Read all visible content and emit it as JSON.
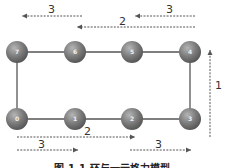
{
  "diagram": {
    "colors": {
      "node_fill": "#7a7a7a",
      "node_highlight": "#a8a8a8",
      "edge": "#555555",
      "arrow": "#555555",
      "text": "#333333"
    },
    "nodes": [
      {
        "id": "0",
        "label": "0",
        "row": "bottom",
        "col": 0
      },
      {
        "id": "1",
        "label": "1",
        "row": "bottom",
        "col": 1
      },
      {
        "id": "2",
        "label": "2",
        "row": "bottom",
        "col": 2
      },
      {
        "id": "3",
        "label": "3",
        "row": "bottom",
        "col": 3
      },
      {
        "id": "4",
        "label": "4",
        "row": "top",
        "col": 3
      },
      {
        "id": "5",
        "label": "5",
        "row": "top",
        "col": 2
      },
      {
        "id": "6",
        "label": "6",
        "row": "top",
        "col": 1
      },
      {
        "id": "7",
        "label": "7",
        "row": "top",
        "col": 0
      }
    ],
    "edges": [
      {
        "from": "0",
        "to": "1"
      },
      {
        "from": "1",
        "to": "2"
      },
      {
        "from": "2",
        "to": "3"
      },
      {
        "from": "3",
        "to": "4"
      },
      {
        "from": "4",
        "to": "5"
      },
      {
        "from": "5",
        "to": "6"
      },
      {
        "from": "6",
        "to": "7"
      },
      {
        "from": "7",
        "to": "0"
      }
    ],
    "arrows": [
      {
        "name": "top-left-arrow",
        "label": "3",
        "from_node": "6",
        "to_node": "7",
        "direction": "left"
      },
      {
        "name": "top-right-arrow",
        "label": "3",
        "from_node": "4",
        "to_node": "5",
        "direction": "left"
      },
      {
        "name": "top-middle-arrow",
        "label": "2",
        "from_node": "4",
        "to_node": "6",
        "direction": "left"
      },
      {
        "name": "right-vertical-arrow",
        "label": "1",
        "from_node": "3",
        "to_node": "4",
        "direction": "up"
      },
      {
        "name": "bottom-middle-arrow",
        "label": "2",
        "from_node": "0",
        "to_node": "2",
        "direction": "right"
      },
      {
        "name": "bottom-left-arrow",
        "label": "3",
        "from_node": "0",
        "to_node": "1",
        "direction": "right"
      },
      {
        "name": "bottom-right-arrow",
        "label": "3",
        "from_node": "2",
        "to_node": "3",
        "direction": "right"
      }
    ],
    "caption": "图 1-1  环与一元格力模型"
  }
}
